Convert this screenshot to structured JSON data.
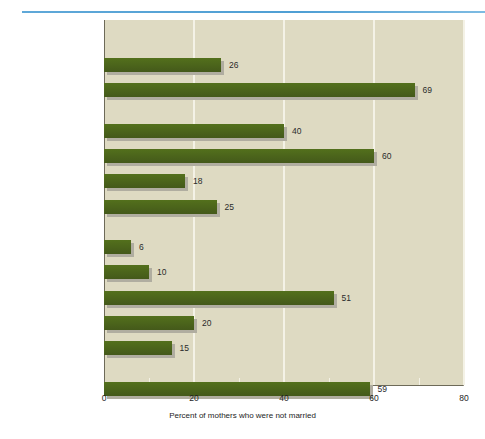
{
  "chart_data": {
    "type": "bar",
    "orientation": "horizontal",
    "title": "",
    "xlabel": "Percent of mothers who were not married",
    "ylabel": "",
    "xlim": [
      0,
      80
    ],
    "xticks": [
      0,
      20,
      40,
      60,
      80
    ],
    "xtick_labels": [
      "0",
      "20",
      "40",
      "60",
      "80"
    ],
    "grid": "vertical",
    "legend": "none",
    "bar_color": "#4a6318",
    "plot_background": "#dedac2",
    "categories": [
      "White",
      "African American",
      "Mexican American",
      "Puerto Rican",
      "Cuban American",
      "Cent. & S. American",
      "Chinese American",
      "Japanese American",
      "Hawaiian",
      "Filipino American",
      "Other",
      "AMERICAN INDIAN"
    ],
    "values": [
      26,
      69,
      40,
      60,
      18,
      25,
      6,
      10,
      51,
      20,
      15,
      59
    ],
    "group_headers": [
      "NON-HISPANIC",
      "HISPANIC",
      "ASIAN/PACIFIC ISL."
    ],
    "groups": [
      {
        "header": "NON-HISPANIC",
        "items": [
          {
            "label": "White",
            "value": 26
          },
          {
            "label": "African American",
            "value": 69
          }
        ]
      },
      {
        "header": "HISPANIC",
        "items": [
          {
            "label": "Mexican American",
            "value": 40
          },
          {
            "label": "Puerto Rican",
            "value": 60
          },
          {
            "label": "Cuban American",
            "value": 18
          },
          {
            "label": "Cent. & S. American",
            "value": 25
          }
        ]
      },
      {
        "header": "ASIAN/PACIFIC ISL.",
        "items": [
          {
            "label": "Chinese American",
            "value": 6
          },
          {
            "label": "Japanese American",
            "value": 10
          },
          {
            "label": "Hawaiian",
            "value": 51
          },
          {
            "label": "Filipino American",
            "value": 20
          },
          {
            "label": "Other",
            "value": 15
          }
        ]
      },
      {
        "header": "",
        "items": [
          {
            "label": "AMERICAN INDIAN",
            "value": 59
          }
        ]
      }
    ]
  },
  "decoration": {
    "top_rule_color": "#4f9fd4"
  }
}
